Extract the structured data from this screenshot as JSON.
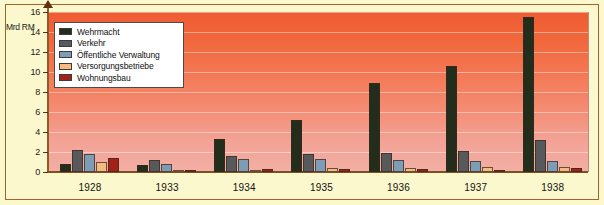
{
  "chart_data": {
    "type": "bar",
    "title": "",
    "xlabel": "",
    "ylabel": "Mrd RM",
    "unit_label": "Mrd RM",
    "ylim": [
      0,
      16
    ],
    "ytick_labels": [
      "0",
      "2",
      "4",
      "6",
      "8",
      "10",
      "12",
      "14",
      "16"
    ],
    "ytick_values": [
      0,
      2,
      4,
      6,
      8,
      10,
      12,
      14,
      16
    ],
    "grid": true,
    "grid_orientation": "horizontal",
    "legend_position": "top-left",
    "categories": [
      "1928",
      "1933",
      "1934",
      "1935",
      "1936",
      "1937",
      "1938"
    ],
    "series": [
      {
        "name": "Wehrmacht",
        "color": "#232d1c",
        "values": [
          0.8,
          0.7,
          3.3,
          5.2,
          8.9,
          10.6,
          15.5
        ]
      },
      {
        "name": "Verkehr",
        "color": "#58595b",
        "values": [
          2.2,
          1.2,
          1.6,
          1.8,
          1.9,
          2.1,
          3.2
        ]
      },
      {
        "name": "Öffentliche Verwaltung",
        "color": "#7d9cb5",
        "values": [
          1.8,
          0.8,
          1.3,
          1.3,
          1.2,
          1.1,
          1.1
        ]
      },
      {
        "name": "Versorgungsbetriebe",
        "color": "#f5bb7e",
        "values": [
          1.0,
          0.2,
          0.2,
          0.4,
          0.45,
          0.5,
          0.5
        ]
      },
      {
        "name": "Wohnungsbau",
        "color": "#a32218",
        "values": [
          1.4,
          0.25,
          0.3,
          0.3,
          0.3,
          0.25,
          0.4
        ]
      }
    ]
  },
  "colors": {
    "background": "#fbf8cd",
    "border": "#a4622c",
    "plot_top": "#ef5b32",
    "plot_bottom": "#f2afa4",
    "axis": "#7d4f22",
    "legend_background": "#ffffff",
    "legend_border": "#4a4a4a"
  }
}
